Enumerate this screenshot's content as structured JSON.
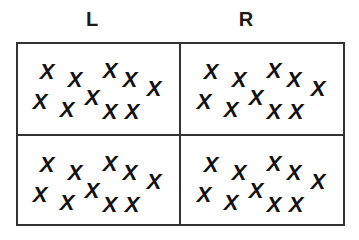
{
  "columns": [
    {
      "label": "L",
      "x": 92
    },
    {
      "label": "R",
      "x": 246
    }
  ],
  "mark_glyph": "X",
  "cells": [
    {
      "name": "top-left",
      "left": 16,
      "top": 42
    },
    {
      "name": "top-right",
      "left": 180,
      "top": 42
    },
    {
      "name": "bottom-left",
      "left": 16,
      "top": 135
    },
    {
      "name": "bottom-right",
      "left": 180,
      "top": 135
    }
  ],
  "mark_positions": [
    [
      31,
      30
    ],
    [
      59,
      38
    ],
    [
      94,
      29
    ],
    [
      114,
      38
    ],
    [
      138,
      47
    ],
    [
      24,
      60
    ],
    [
      51,
      68
    ],
    [
      76,
      56
    ],
    [
      94,
      70
    ],
    [
      116,
      70
    ]
  ],
  "colors": {
    "line": "#333333",
    "mark": "#111111",
    "background": "#ffffff"
  }
}
